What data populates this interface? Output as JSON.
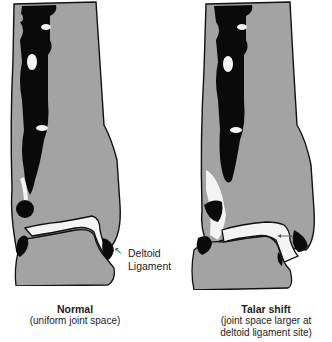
{
  "figure": {
    "colors": {
      "bone_gray": "#a3a3a3",
      "medullary_black": "#0a0a0a",
      "joint_space_white": "#f4f4f4",
      "outline": "#111111",
      "text": "#222222"
    },
    "panels": [
      {
        "id": "normal",
        "title": "Normal",
        "subtitle": "(uniform joint space)",
        "annotation": {
          "line1": "Deltoid",
          "line2": "Ligament",
          "arrow": "arrow-up-left"
        }
      },
      {
        "id": "talar-shift",
        "title": "Talar shift",
        "subtitle_line1": "(joint space larger at",
        "subtitle_line2": "deltoid ligament site)",
        "marker": "double-headed-arrow"
      }
    ]
  }
}
